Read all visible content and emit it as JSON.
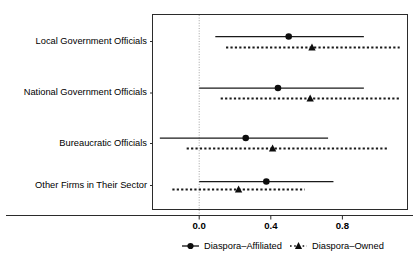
{
  "chart_data": {
    "type": "scatter",
    "title": "",
    "subtitle": "",
    "xlabel": "",
    "ylabel": "",
    "xlim": [
      -0.25,
      1.17
    ],
    "ylim": [
      0,
      4
    ],
    "grid": false,
    "zero_reference_line": 0.0,
    "xticks": [
      0.0,
      0.4,
      0.8
    ],
    "xticklabels": [
      "0.0",
      "0.4",
      "0.8"
    ],
    "categories": [
      "Local Government Officials",
      "National Government Officials",
      "Bureaucratic Officials",
      "Other Firms in Their Sector"
    ],
    "legend": {
      "position": "bottom",
      "entries": [
        {
          "name": "Diaspora–Affiliated",
          "marker": "circle",
          "line": "solid"
        },
        {
          "name": "Diaspora–Owned",
          "marker": "triangle",
          "line": "dotted"
        }
      ]
    },
    "series": [
      {
        "name": "Diaspora–Affiliated",
        "marker": "circle",
        "line": "solid",
        "color": "#0d0d0d",
        "values": [
          0.5,
          0.44,
          0.26,
          0.375
        ],
        "ci_low": [
          0.09,
          0.0,
          -0.22,
          0.0
        ],
        "ci_high": [
          0.92,
          0.92,
          0.72,
          0.75
        ]
      },
      {
        "name": "Diaspora–Owned",
        "marker": "triangle",
        "line": "dotted",
        "color": "#0d0d0d",
        "values": [
          0.63,
          0.62,
          0.41,
          0.22
        ],
        "ci_low": [
          0.15,
          0.12,
          -0.07,
          -0.15
        ],
        "ci_high": [
          1.12,
          1.12,
          1.05,
          0.59
        ]
      }
    ]
  },
  "figure": {
    "background": "#ffffff",
    "frame_color": "#2b2b2b",
    "marker_color": "#0d0d0d",
    "zero_line_color": "#9a9a9a"
  }
}
